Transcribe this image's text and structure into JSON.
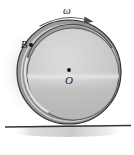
{
  "figure": {
    "kind": "physics-diagram",
    "background_color": "#ffffff",
    "labels": {
      "angular_velocity": "ω",
      "point_b": "B",
      "center_o": "O"
    },
    "colors": {
      "background": "#ffffff",
      "rim_outer": "#8d8d8d",
      "rim_dark": "#7d7d7d",
      "disk_fill": "#c8c8c8",
      "disk_highlight": "#dcdcdc",
      "disk_lower": "#b4b4b4",
      "inner_ring_light": "#e3e3e3",
      "outline": "#2a2a2a",
      "ground_line": "#3a3a3a",
      "shadow": "#bdbdbd",
      "marker": "#111111",
      "arrow": "#4a4a4a"
    },
    "geometry": {
      "wheel_center_x": 69,
      "wheel_center_y": 72,
      "wheel_outer_radius": 52,
      "inner_circle_center_x": 73,
      "inner_circle_center_y": 74,
      "inner_circle_radius": 46,
      "center_dot_x": 69,
      "center_dot_y": 70,
      "point_b_x": 27,
      "point_b_y": 45,
      "ground_y": 127,
      "ground_x_start": 5,
      "ground_x_end": 131
    },
    "arrow": {
      "name": "angular-velocity-arc-arrow",
      "direction": "clockwise",
      "start_x": 41,
      "start_y": 26,
      "end_x": 93,
      "end_y": 22
    }
  }
}
